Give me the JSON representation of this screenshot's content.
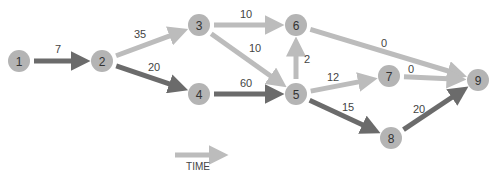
{
  "diagram": {
    "type": "network-graph",
    "colors": {
      "node_fill": "#b4b4b4",
      "critical_edge": "#6b6b6b",
      "normal_edge": "#bcbcbc",
      "text": "#333333"
    },
    "nodes": [
      {
        "id": "1",
        "label": "1",
        "x": 19,
        "y": 61
      },
      {
        "id": "2",
        "label": "2",
        "x": 102,
        "y": 61
      },
      {
        "id": "3",
        "label": "3",
        "x": 199,
        "y": 25
      },
      {
        "id": "4",
        "label": "4",
        "x": 199,
        "y": 94
      },
      {
        "id": "5",
        "label": "5",
        "x": 296,
        "y": 94
      },
      {
        "id": "6",
        "label": "6",
        "x": 296,
        "y": 25
      },
      {
        "id": "7",
        "label": "7",
        "x": 389,
        "y": 76
      },
      {
        "id": "8",
        "label": "8",
        "x": 391,
        "y": 138
      },
      {
        "id": "9",
        "label": "9",
        "x": 478,
        "y": 80
      }
    ],
    "edges": [
      {
        "from": "1",
        "to": "2",
        "label": "7",
        "critical": true,
        "lx": 58,
        "ly": 53
      },
      {
        "from": "2",
        "to": "3",
        "label": "35",
        "critical": false,
        "lx": 140,
        "ly": 38
      },
      {
        "from": "2",
        "to": "4",
        "label": "20",
        "critical": true,
        "lx": 154,
        "ly": 71
      },
      {
        "from": "3",
        "to": "6",
        "label": "10",
        "critical": false,
        "lx": 246,
        "ly": 18
      },
      {
        "from": "3",
        "to": "5",
        "label": "10",
        "critical": false,
        "lx": 255,
        "ly": 52
      },
      {
        "from": "4",
        "to": "5",
        "label": "60",
        "critical": true,
        "lx": 246,
        "ly": 87
      },
      {
        "from": "5",
        "to": "6",
        "label": "2",
        "critical": false,
        "lx": 307,
        "ly": 63
      },
      {
        "from": "6",
        "to": "9",
        "label": "0",
        "critical": false,
        "lx": 384,
        "ly": 47
      },
      {
        "from": "5",
        "to": "7",
        "label": "12",
        "critical": false,
        "lx": 333,
        "ly": 81
      },
      {
        "from": "7",
        "to": "9",
        "label": "0",
        "critical": false,
        "lx": 411,
        "ly": 73
      },
      {
        "from": "5",
        "to": "8",
        "label": "15",
        "critical": true,
        "lx": 348,
        "ly": 111
      },
      {
        "from": "8",
        "to": "9",
        "label": "20",
        "critical": true,
        "lx": 419,
        "ly": 113
      }
    ],
    "legend": {
      "label": "TIME",
      "x1": 175,
      "x2": 229,
      "y": 155,
      "label_y": 170
    }
  }
}
